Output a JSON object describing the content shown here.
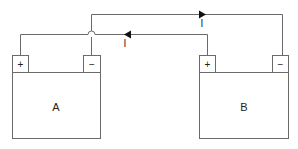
{
  "diagram": {
    "type": "circuit",
    "batteries": [
      {
        "id": "A",
        "label": "A",
        "plus": "+",
        "minus": "−"
      },
      {
        "id": "B",
        "label": "B",
        "plus": "+",
        "minus": "−"
      }
    ],
    "currents": [
      {
        "label": "I",
        "direction": "right",
        "wire": "top"
      },
      {
        "label": "I",
        "direction": "left",
        "wire": "lower"
      }
    ],
    "connections": [
      {
        "from": "A.minus",
        "to": "B.minus",
        "wire": "top"
      },
      {
        "from": "A.plus",
        "to": "B.plus",
        "wire": "lower"
      }
    ],
    "colors": {
      "line": "#6a6a6a",
      "arrow": "#111111"
    }
  }
}
